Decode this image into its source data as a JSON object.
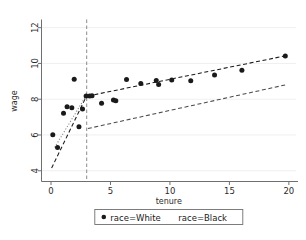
{
  "chart_data": {
    "type": "scatter",
    "title": "",
    "xlabel": "tenure",
    "ylabel": "wage",
    "xlim": [
      -0.8,
      20.6
    ],
    "ylim": [
      3.4,
      12.4
    ],
    "xticks": [
      0,
      5,
      10,
      15,
      20
    ],
    "yticks": [
      4,
      6,
      8,
      10,
      12
    ],
    "xtick_labels": [
      "0",
      "5",
      "10",
      "15",
      "20"
    ],
    "ytick_labels": [
      "4",
      "6",
      "8",
      "10",
      "12"
    ],
    "grid": "horizontal",
    "legend_position": "bottom-center",
    "cutoff": {
      "name": "discontinuity-line",
      "x": 3.0,
      "style": "dashed",
      "color": "#8c8c8c"
    },
    "series": [
      {
        "name": "race=White",
        "marker": "circle",
        "color": "#1a1a1a",
        "points": [
          [
            0.15,
            6.02
          ],
          [
            0.55,
            5.3
          ],
          [
            1.05,
            7.22
          ],
          [
            1.35,
            7.58
          ],
          [
            1.75,
            7.52
          ],
          [
            1.95,
            9.12
          ],
          [
            2.35,
            6.46
          ],
          [
            2.65,
            7.45
          ],
          [
            2.95,
            8.18
          ],
          [
            3.25,
            8.18
          ],
          [
            3.45,
            8.2
          ],
          [
            4.25,
            7.78
          ],
          [
            5.25,
            7.95
          ],
          [
            5.45,
            7.92
          ],
          [
            6.35,
            9.1
          ],
          [
            7.55,
            8.88
          ],
          [
            8.85,
            9.05
          ],
          [
            9.05,
            8.82
          ],
          [
            10.15,
            9.08
          ],
          [
            11.75,
            9.03
          ],
          [
            13.75,
            9.35
          ],
          [
            16.05,
            9.62
          ],
          [
            19.7,
            10.42
          ]
        ]
      },
      {
        "name": "race=Black",
        "marker": "diamond",
        "color": "#8a8a8a",
        "points": [
          [
            0.12,
            5.5
          ],
          [
            0.35,
            4.38
          ],
          [
            0.6,
            3.85
          ],
          [
            1.25,
            4.25
          ],
          [
            1.45,
            6.45
          ],
          [
            1.95,
            6.08
          ],
          [
            2.15,
            6.25
          ],
          [
            1.65,
            9.22
          ],
          [
            2.8,
            8.22
          ],
          [
            3.3,
            5.92
          ],
          [
            3.55,
            4.95
          ],
          [
            4.3,
            5.95
          ],
          [
            5.35,
            7.95
          ],
          [
            6.35,
            7.42
          ],
          [
            7.55,
            6.85
          ],
          [
            8.85,
            8.82
          ],
          [
            10.15,
            8.35
          ],
          [
            11.75,
            7.3
          ],
          [
            13.75,
            7.38
          ],
          [
            16.05,
            8.45
          ],
          [
            19.45,
            8.72
          ]
        ]
      }
    ],
    "fit_lines": [
      {
        "name": "white-left-fit",
        "series": "race=White",
        "side": "left",
        "style": "dashed",
        "color": "#1a1a1a",
        "x0": 0.05,
        "y0": 4.15,
        "x1": 3.0,
        "y1": 8.2
      },
      {
        "name": "white-right-fit",
        "series": "race=White",
        "side": "right",
        "style": "dashed",
        "color": "#1a1a1a",
        "x0": 3.1,
        "y0": 8.18,
        "x1": 19.9,
        "y1": 10.45
      },
      {
        "name": "black-left-fit",
        "series": "race=Black",
        "side": "left",
        "style": "dotted",
        "color": "#8a8a8a",
        "x0": 0.3,
        "y0": 5.3,
        "x1": 3.0,
        "y1": 8.25
      },
      {
        "name": "black-right-fit",
        "series": "race=Black",
        "side": "right",
        "style": "dashed",
        "color": "#4a4a4a",
        "x0": 3.1,
        "y0": 6.36,
        "x1": 19.7,
        "y1": 8.8
      }
    ],
    "legend": [
      {
        "label": "race=White",
        "marker": "circle",
        "color": "#1a1a1a"
      },
      {
        "label": "race=Black",
        "marker": "diamond",
        "color": "#8a8a8a"
      }
    ]
  }
}
